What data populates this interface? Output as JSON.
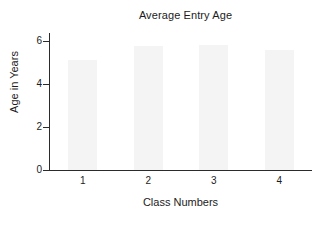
{
  "chart_data": {
    "type": "bar",
    "title": "Average Entry Age",
    "xlabel": "Class Numbers",
    "ylabel": "Age in Years",
    "categories": [
      "1",
      "2",
      "3",
      "4"
    ],
    "values": [
      5.1,
      5.75,
      5.8,
      5.6
    ],
    "series": [
      {
        "name": "Average Entry Age",
        "values": [
          5.1,
          5.75,
          5.8,
          5.6
        ]
      }
    ],
    "ylim": [
      0,
      6.33
    ],
    "yticks": [
      0,
      2,
      4,
      6
    ],
    "ytick_labels": [
      "0",
      "2",
      "4",
      "6"
    ],
    "xtick_labels": [
      "1",
      "2",
      "3",
      "4"
    ],
    "grid": false,
    "legend": false,
    "legend_position": "none",
    "bar_color": "#f4f4f4",
    "axis_color": "#2b2b2b",
    "background_color": "#ffffff"
  }
}
